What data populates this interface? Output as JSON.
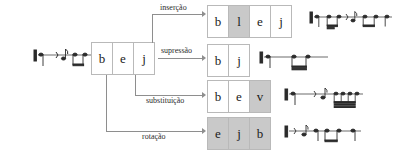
{
  "diagram": {
    "source_sequence": {
      "label": "source-word",
      "letters": [
        "b",
        "e",
        "j"
      ],
      "highlight": [
        false,
        false,
        false
      ]
    },
    "operations": [
      {
        "name": "insercao",
        "label": "inserção",
        "letters": [
          "b",
          "l",
          "e",
          "j"
        ],
        "highlight": [
          false,
          true,
          false,
          false
        ],
        "notation_name": "staff-insercao",
        "note_count": 7
      },
      {
        "name": "supressao",
        "label": "supressão",
        "letters": [
          "b",
          "j"
        ],
        "highlight": [
          false,
          false
        ],
        "notation_name": "staff-supressao",
        "note_count": 3
      },
      {
        "name": "substituicao",
        "label": "substituição",
        "letters": [
          "b",
          "e",
          "v"
        ],
        "highlight": [
          false,
          false,
          true
        ],
        "notation_name": "staff-substituicao",
        "note_count": 6
      },
      {
        "name": "rotacao",
        "label": "rotação",
        "letters": [
          "e",
          "j",
          "b"
        ],
        "highlight": [
          true,
          true,
          true
        ],
        "notation_name": "staff-rotacao",
        "note_count": 6
      }
    ],
    "source_notation_name": "staff-original",
    "colors": {
      "highlight_fill": "#c9c9c9",
      "box_border": "#b9b9b9",
      "line": "#8e8e8e",
      "text": "#1a1a1a",
      "staff_ink": "#2b2b2b"
    }
  }
}
